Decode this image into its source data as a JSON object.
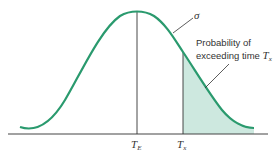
{
  "diagram": {
    "type": "normal-distribution",
    "curve_label": "σ",
    "annotation_line1": "Probability of",
    "annotation_line2": "exceeding time ",
    "annotation_var": "T",
    "annotation_sub": "x",
    "mean_label": "T",
    "mean_sub": "E",
    "threshold_label": "T",
    "threshold_sub": "x",
    "colors": {
      "curve": "#2a9a6e",
      "shade": "#cde8df",
      "axis": "#444444"
    }
  }
}
